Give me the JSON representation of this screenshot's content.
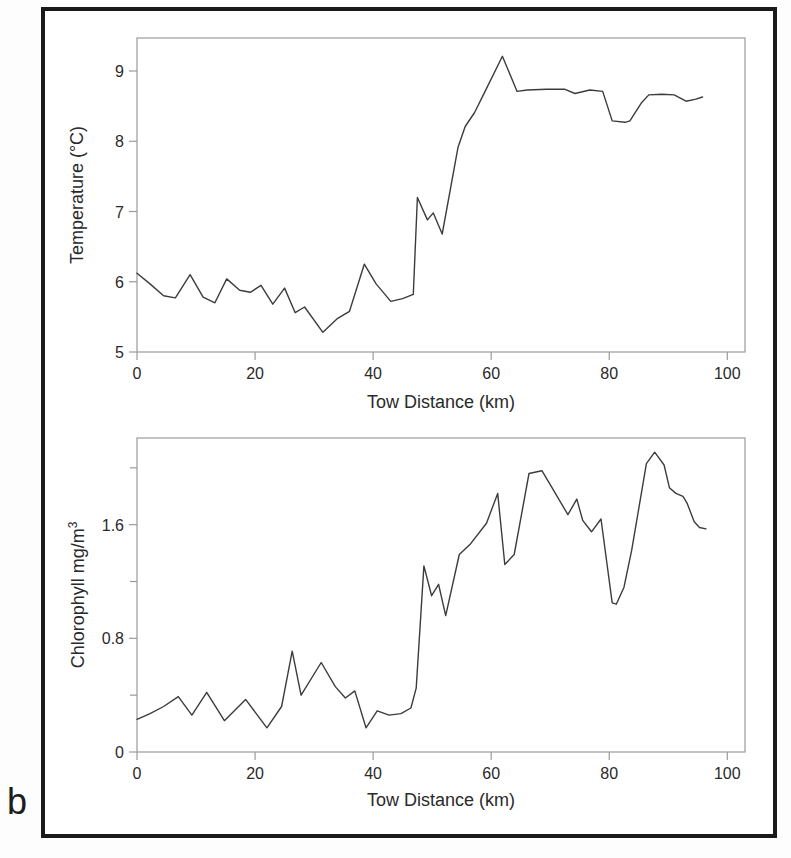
{
  "figure": {
    "panel_label": "b"
  },
  "colors": {
    "line": "#3c3c3c",
    "axis": "#9a9a9a",
    "text": "#2a2a2a",
    "frame": "#1a1a1a",
    "background": "#ffffff"
  },
  "chart_data": [
    {
      "id": "temperature",
      "type": "line",
      "title": "",
      "xlabel": "Tow Distance (km)",
      "ylabel": "Temperature (°C)",
      "xlim": [
        0,
        103
      ],
      "ylim": [
        5,
        9.47
      ],
      "xticks": [
        0,
        20,
        40,
        60,
        80,
        100
      ],
      "yticks": [
        5,
        6,
        7,
        8,
        9
      ],
      "yticks_minor": [],
      "grid": false,
      "legend": null,
      "points": [
        [
          0,
          6.12
        ],
        [
          2.2,
          5.97
        ],
        [
          4.5,
          5.8
        ],
        [
          6.5,
          5.77
        ],
        [
          9,
          6.1
        ],
        [
          11.2,
          5.78
        ],
        [
          13.2,
          5.7
        ],
        [
          15.2,
          6.04
        ],
        [
          17.4,
          5.88
        ],
        [
          19.2,
          5.85
        ],
        [
          21,
          5.95
        ],
        [
          23,
          5.68
        ],
        [
          25,
          5.91
        ],
        [
          26.8,
          5.56
        ],
        [
          28.4,
          5.64
        ],
        [
          31.5,
          5.28
        ],
        [
          34,
          5.48
        ],
        [
          36,
          5.58
        ],
        [
          38.5,
          6.25
        ],
        [
          40.5,
          5.97
        ],
        [
          43,
          5.72
        ],
        [
          45,
          5.76
        ],
        [
          46.8,
          5.82
        ],
        [
          47.5,
          7.2
        ],
        [
          49.2,
          6.88
        ],
        [
          50.2,
          6.98
        ],
        [
          51.7,
          6.68
        ],
        [
          54.4,
          7.92
        ],
        [
          55.6,
          8.21
        ],
        [
          57.2,
          8.41
        ],
        [
          58.9,
          8.7
        ],
        [
          61.9,
          9.21
        ],
        [
          64.4,
          8.71
        ],
        [
          66.1,
          8.73
        ],
        [
          69.4,
          8.74
        ],
        [
          72.5,
          8.74
        ],
        [
          74.2,
          8.68
        ],
        [
          76.7,
          8.73
        ],
        [
          78.9,
          8.71
        ],
        [
          80.5,
          8.29
        ],
        [
          82.7,
          8.27
        ],
        [
          83.5,
          8.29
        ],
        [
          85.4,
          8.54
        ],
        [
          86.7,
          8.66
        ],
        [
          88.9,
          8.67
        ],
        [
          91,
          8.66
        ],
        [
          93,
          8.57
        ],
        [
          94.7,
          8.6
        ],
        [
          95.8,
          8.63
        ]
      ]
    },
    {
      "id": "chlorophyll",
      "type": "line",
      "title": "",
      "xlabel": "Tow Distance (km)",
      "ylabel": "Chlorophyll mg/m³",
      "ylabel_base": "Chlorophyll mg/m",
      "ylabel_sup": "3",
      "xlim": [
        0,
        103
      ],
      "ylim": [
        0,
        2.21
      ],
      "xticks": [
        0,
        20,
        40,
        60,
        80,
        100
      ],
      "yticks": [
        0,
        0.8,
        1.6
      ],
      "yticks_minor": [
        0.4,
        1.2,
        2.0
      ],
      "grid": false,
      "legend": null,
      "points": [
        [
          0,
          0.23
        ],
        [
          2.2,
          0.27
        ],
        [
          4.5,
          0.32
        ],
        [
          7,
          0.39
        ],
        [
          9.3,
          0.26
        ],
        [
          11.8,
          0.42
        ],
        [
          14.8,
          0.22
        ],
        [
          18.4,
          0.37
        ],
        [
          22,
          0.17
        ],
        [
          24.5,
          0.32
        ],
        [
          26.3,
          0.71
        ],
        [
          27.8,
          0.4
        ],
        [
          31.2,
          0.63
        ],
        [
          33.6,
          0.46
        ],
        [
          35.3,
          0.38
        ],
        [
          36.9,
          0.43
        ],
        [
          38.8,
          0.17
        ],
        [
          40.7,
          0.29
        ],
        [
          42.7,
          0.26
        ],
        [
          44.7,
          0.27
        ],
        [
          46.4,
          0.31
        ],
        [
          47.3,
          0.45
        ],
        [
          48.6,
          1.31
        ],
        [
          49.9,
          1.1
        ],
        [
          51.1,
          1.18
        ],
        [
          52.3,
          0.96
        ],
        [
          54.6,
          1.39
        ],
        [
          56.4,
          1.46
        ],
        [
          59.2,
          1.61
        ],
        [
          61.1,
          1.82
        ],
        [
          62.3,
          1.32
        ],
        [
          63.9,
          1.39
        ],
        [
          66.4,
          1.96
        ],
        [
          68.6,
          1.98
        ],
        [
          70.3,
          1.86
        ],
        [
          73,
          1.67
        ],
        [
          74.5,
          1.78
        ],
        [
          75.5,
          1.63
        ],
        [
          77,
          1.55
        ],
        [
          78.6,
          1.64
        ],
        [
          80.5,
          1.05
        ],
        [
          81.2,
          1.04
        ],
        [
          82.5,
          1.16
        ],
        [
          83.8,
          1.42
        ],
        [
          86.3,
          2.03
        ],
        [
          87.7,
          2.11
        ],
        [
          89.3,
          2.02
        ],
        [
          90.2,
          1.86
        ],
        [
          91.3,
          1.82
        ],
        [
          92.5,
          1.8
        ],
        [
          93.2,
          1.75
        ],
        [
          94.4,
          1.62
        ],
        [
          95.3,
          1.58
        ],
        [
          96.4,
          1.57
        ]
      ]
    }
  ]
}
